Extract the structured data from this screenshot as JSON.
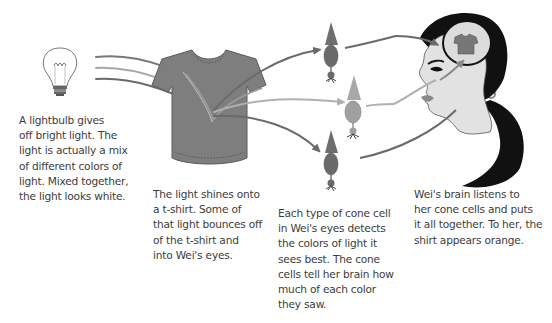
{
  "diagram": {
    "palette": {
      "light_ray_dark": "#6a6a6a",
      "light_ray_mid": "#8c8c8c",
      "light_ray_light": "#b8b8b8",
      "shirt": "#7e7e7e",
      "shirt_outline": "#5a5a5a",
      "cone_dark": "#6e6e6e",
      "cone_light": "#a8a8a8",
      "skin": "#e2e2e2",
      "hair": "#111111",
      "brain": "#dcdcdc",
      "text": "#3c3c3c"
    },
    "stages": [
      {
        "id": "lightbulb",
        "icon": "lightbulb-icon",
        "caption": "A lightbulb gives\noff bright light. The\nlight is actually a mix\nof different colors of\nlight. Mixed together,\nthe light looks white."
      },
      {
        "id": "tshirt",
        "icon": "tshirt-icon",
        "caption": "The light shines onto\na t-shirt. Some of\nthat light bounces off\nof the t-shirt and\ninto Wei's eyes."
      },
      {
        "id": "cone-cells",
        "icon": "cone-cell-icon",
        "count": 3,
        "caption": "Each type of cone cell\nin Wei's eyes detects\nthe colors of light it\nsees best. The cone\ncells tell her brain how\nmuch of each color\nthey saw."
      },
      {
        "id": "brain",
        "icon": "head-brain-icon",
        "caption": "Wei's brain listens to\nher cone cells and puts\nit all together. To her, the\nshirt appears orange."
      }
    ]
  }
}
